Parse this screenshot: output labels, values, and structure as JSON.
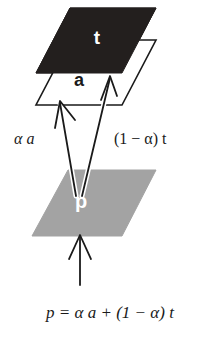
{
  "figure": {
    "background_color": "#ffffff"
  },
  "planes": {
    "top": {
      "name": "t",
      "label": "t",
      "fill_color": "#231f1e",
      "label_color": "#ffffff",
      "stroke_color": "#231f1e"
    },
    "middle": {
      "name": "a",
      "label": "a",
      "fill_color": "#ffffff",
      "label_color": "#1a1a1a",
      "stroke_color": "#1a1a1a"
    },
    "bottom": {
      "name": "p",
      "label": "p",
      "fill_color": "#a3a3a3",
      "label_color": "#ffffff",
      "stroke_color": "#a3a3a3"
    }
  },
  "annotations": {
    "left_term": "α a",
    "right_term": "(1 − α) t"
  },
  "equation": {
    "text": "p = α a + (1 − α) t"
  },
  "arrows": {
    "alpha_a_arrow": "arrow from p plane up-left to a plane",
    "one_minus_alpha_t_arrow": "arrow from p plane up-right to t plane",
    "input_arrow": "vertical arrow pointing up into p plane"
  }
}
